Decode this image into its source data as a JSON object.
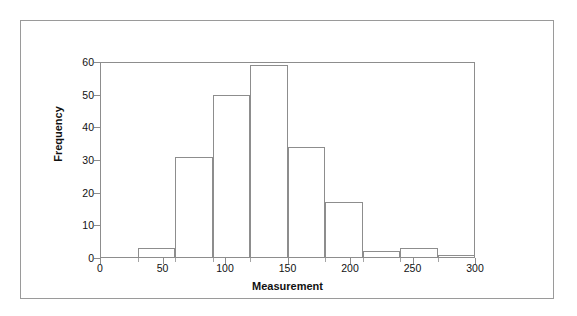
{
  "chart_data": {
    "type": "bar",
    "title": "",
    "xlabel": "Measurement",
    "ylabel": "Frequency",
    "xlim": [
      0,
      300
    ],
    "ylim": [
      0,
      60
    ],
    "grid": false,
    "legend": null,
    "bin_width": 30,
    "bin_edges": [
      30,
      60,
      90,
      120,
      150,
      180,
      210,
      240,
      270,
      300
    ],
    "categories": [
      "30-60",
      "60-90",
      "90-120",
      "120-150",
      "150-180",
      "180-210",
      "210-240",
      "240-270",
      "270-300"
    ],
    "values": [
      3,
      31,
      50,
      59,
      34,
      17,
      2,
      3,
      1
    ],
    "x_ticks": [
      0,
      50,
      100,
      150,
      200,
      250,
      300
    ],
    "x_tick_labels": [
      "0",
      "50",
      "100",
      "150",
      "200",
      "250",
      "300"
    ],
    "x_minor_ticks": [
      30,
      60,
      90,
      120,
      150,
      180,
      210,
      240,
      270
    ],
    "y_ticks": [
      0,
      10,
      20,
      30,
      40,
      50,
      60
    ],
    "y_tick_labels": [
      "0",
      "10",
      "20",
      "30",
      "40",
      "50",
      "60"
    ],
    "colors": {
      "bar_edge": "#8d8d8d",
      "bar_fill": "none",
      "axis": "#8d8d8d",
      "text": "#111111",
      "background": "#ffffff",
      "outer_border": "#9a9a9a"
    }
  }
}
